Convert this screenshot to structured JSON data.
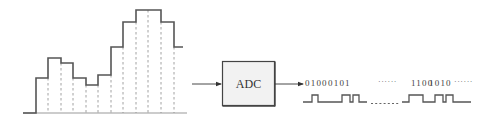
{
  "diagram": {
    "analog_signal": {
      "label": "sampled-staircase-signal",
      "baseline_y": 113,
      "axis_x_start": 23,
      "axis_x_end": 187,
      "stroke_color": "#555555",
      "sample_line_color": "#8a8a8a",
      "steps": [
        {
          "x0": 36,
          "x1": 48,
          "y": 78
        },
        {
          "x0": 48,
          "x1": 61,
          "y": 58
        },
        {
          "x0": 61,
          "x1": 73,
          "y": 63
        },
        {
          "x0": 73,
          "x1": 86,
          "y": 78
        },
        {
          "x0": 86,
          "x1": 98,
          "y": 85
        },
        {
          "x0": 98,
          "x1": 111,
          "y": 75
        },
        {
          "x0": 111,
          "x1": 123,
          "y": 47
        },
        {
          "x0": 123,
          "x1": 136,
          "y": 22
        },
        {
          "x0": 136,
          "x1": 161,
          "y": 10
        },
        {
          "x0": 161,
          "x1": 174,
          "y": 22
        },
        {
          "x0": 174,
          "x1": 183,
          "y": 47
        }
      ],
      "sample_lines_x": [
        48,
        61,
        73,
        86,
        98,
        111,
        123,
        136,
        148,
        161,
        174
      ]
    },
    "converter": {
      "label": "ADC",
      "fill_color": "#f2f2f2",
      "border_color": "#444444"
    },
    "digital_output": {
      "codes": [
        "0100",
        "0101",
        "1100",
        "1010"
      ],
      "ellipsis": "······",
      "ellipsis_end": "······"
    }
  }
}
